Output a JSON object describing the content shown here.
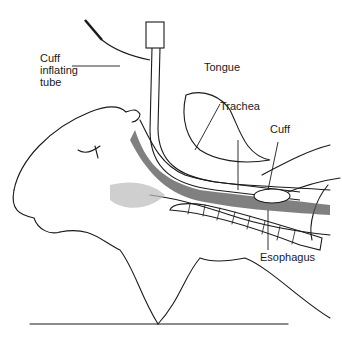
{
  "diagram": {
    "labels": {
      "cuff_inflating_tube": [
        "Cuff",
        "inflating",
        "tube"
      ],
      "tongue": "Tongue",
      "trachea": "Trachea",
      "cuff": "Cuff",
      "esophagus": "Esophagus"
    },
    "colors": {
      "line": "#1a1a1a",
      "background": "#ffffff",
      "shade": "#555555"
    }
  }
}
